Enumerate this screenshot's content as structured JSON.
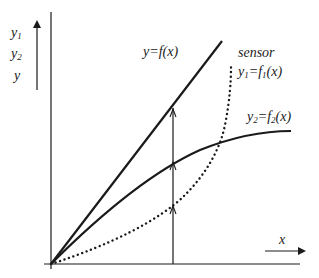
{
  "diagram": {
    "axis_labels": {
      "y_stack": [
        "y1",
        "y2",
        "y"
      ],
      "y1": {
        "base": "y",
        "sub": "1"
      },
      "y2": {
        "base": "y",
        "sub": "2"
      },
      "y": "y",
      "x": "x"
    },
    "curves": {
      "ideal": {
        "label": "y=f(x)",
        "style": "solid-straight"
      },
      "sensor_title": "sensor",
      "sensor": {
        "label_base": "y",
        "label_sub": "1",
        "label_eq": "=f",
        "label_eq_sub": "1",
        "label_arg": "(x)",
        "style": "dotted"
      },
      "second": {
        "label_base": "y",
        "label_sub": "2",
        "label_eq": "=f",
        "label_eq_sub": "2",
        "label_arg": "(x)",
        "style": "solid-concave"
      }
    },
    "colors": {
      "stroke": "#1a1a1a",
      "background": "#ffffff"
    }
  }
}
